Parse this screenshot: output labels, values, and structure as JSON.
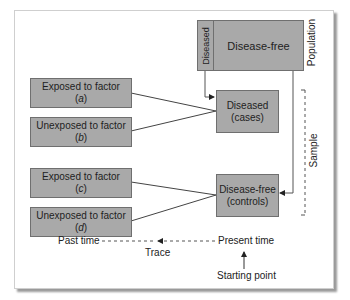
{
  "population": {
    "label": "Population",
    "diseased": "Diseased",
    "disease_free": "Disease-free"
  },
  "sample": {
    "label": "Sample"
  },
  "exposure_boxes": [
    {
      "label": "Exposed to factor",
      "code": "a"
    },
    {
      "label": "Unexposed to factor",
      "code": "b"
    },
    {
      "label": "Exposed to factor",
      "code": "c"
    },
    {
      "label": "Unexposed to factor",
      "code": "d"
    }
  ],
  "cases": {
    "line1": "Diseased",
    "line2": "(cases)"
  },
  "controls": {
    "line1": "Disease-free",
    "line2": "(controls)"
  },
  "timeline": {
    "past": "Past time",
    "present": "Present time",
    "trace": "Trace",
    "start": "Starting point"
  },
  "colors": {
    "box_fill": "#a9a9a9",
    "box_border": "#6f6f6f",
    "line": "#444444"
  }
}
